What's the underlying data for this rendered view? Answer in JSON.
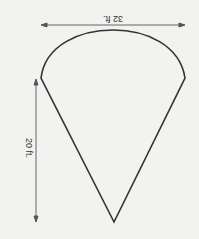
{
  "diagram": {
    "shape": "sector / cone with arc top",
    "dimensions": {
      "width_label": "32 ft.",
      "height_label": "20 ft."
    },
    "colors": {
      "background": "#f2f2f0",
      "outline": "#333333",
      "arrows": "#555555"
    }
  }
}
